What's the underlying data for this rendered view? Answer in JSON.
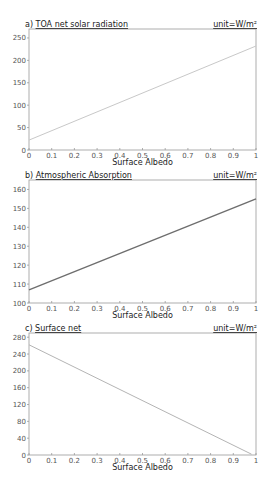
{
  "chart_data": [
    {
      "type": "line",
      "panel": "a",
      "title": "a) TOA net solar radiation",
      "title_prefix": "a)",
      "title_text": "TOA net solar radiation",
      "unit": "unit=W/m²",
      "xlabel": "Surface Albedo",
      "ylabel": "",
      "xlim": [
        0,
        1
      ],
      "ylim": [
        0,
        270
      ],
      "xticks": [
        0,
        0.1,
        0.2,
        0.3,
        0.4,
        0.5,
        0.6,
        0.7,
        0.8,
        0.9,
        1
      ],
      "yticks": [
        0,
        50,
        100,
        150,
        200,
        250
      ],
      "x": [
        0,
        1
      ],
      "values": [
        22,
        232
      ],
      "line_color": "#c8c8c8",
      "box": {
        "x0": 29,
        "x1": 256,
        "y0": 29,
        "y1": 150
      }
    },
    {
      "type": "line",
      "panel": "b",
      "title": "b) Atmospheric Absorption",
      "title_prefix": "b)",
      "title_text": "Atmospheric Absorption",
      "unit": "unit=W/m²",
      "xlabel": "Surface Albedo",
      "ylabel": "",
      "xlim": [
        0,
        1
      ],
      "ylim": [
        100,
        165
      ],
      "xticks": [
        0,
        0.1,
        0.2,
        0.3,
        0.4,
        0.5,
        0.6,
        0.7,
        0.8,
        0.9,
        1
      ],
      "yticks": [
        100,
        110,
        120,
        130,
        140,
        150,
        160
      ],
      "x": [
        0,
        1
      ],
      "values": [
        107,
        155
      ],
      "line_color": "#6e6e6e",
      "box": {
        "x0": 29,
        "x1": 256,
        "y0": 180,
        "y1": 303
      }
    },
    {
      "type": "line",
      "panel": "c",
      "title": "c) Surface net",
      "title_prefix": "c)",
      "title_text": "Surface net",
      "unit": "unit=W/m²",
      "xlabel": "Surface Albedo",
      "ylabel": "",
      "xlim": [
        0,
        1
      ],
      "ylim": [
        0,
        290
      ],
      "xticks": [
        0,
        0.1,
        0.2,
        0.3,
        0.4,
        0.5,
        0.6,
        0.7,
        0.8,
        0.9,
        1
      ],
      "yticks": [
        0,
        40,
        80,
        120,
        160,
        200,
        240,
        280
      ],
      "x": [
        0,
        0.98
      ],
      "values": [
        262,
        2
      ],
      "line_color": "#b4b4b4",
      "box": {
        "x0": 29,
        "x1": 256,
        "y0": 333,
        "y1": 455
      }
    }
  ],
  "colors": {
    "axis": "#9a9a9a",
    "text": "#333333",
    "background": "#ffffff"
  }
}
